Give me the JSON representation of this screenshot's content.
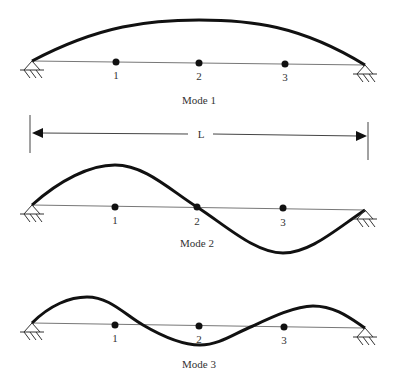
{
  "diagram": {
    "type": "beam-vibration-mode-shapes",
    "colors": {
      "mode_shape": "#111111",
      "beam_axis": "#777777",
      "node": "#111111",
      "text": "#333333",
      "background": "#ffffff"
    },
    "dimension": {
      "label": "L"
    },
    "modes": [
      {
        "label": "Mode 1",
        "nodes": [
          {
            "label": "1"
          },
          {
            "label": "2"
          },
          {
            "label": "3"
          }
        ]
      },
      {
        "label": "Mode 2",
        "nodes": [
          {
            "label": "1"
          },
          {
            "label": "2"
          },
          {
            "label": "3"
          }
        ]
      },
      {
        "label": "Mode 3",
        "nodes": [
          {
            "label": "1"
          },
          {
            "label": "2"
          },
          {
            "label": "3"
          }
        ]
      }
    ]
  }
}
